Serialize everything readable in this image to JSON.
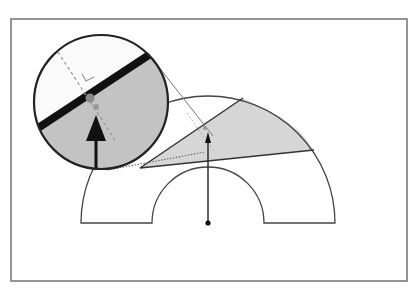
{
  "diagram": {
    "colors": {
      "background": "#ffffff",
      "frame": "#7a7a7a",
      "outline": "#444444",
      "shade": "#d4d4d4",
      "inset_shade": "#c4c4c4",
      "thick_edge": "#111111",
      "arrow": "#111111",
      "dashed": "#9a9a9a",
      "marker": "#8f8f8f"
    },
    "frame": {
      "x": 11,
      "y": 19,
      "width": 396,
      "height": 262
    },
    "annulus": {
      "center": [
        208,
        223
      ],
      "outer_radius": 127,
      "inner_radius": 56
    },
    "wedge": {
      "points": [
        [
          140,
          168
        ],
        [
          243,
          98
        ],
        [
          314,
          150
        ]
      ]
    },
    "arrow": {
      "x": 208,
      "y_base": 223,
      "y_tip": 133
    },
    "inset": {
      "center": [
        101,
        102
      ],
      "radius": 68
    }
  }
}
